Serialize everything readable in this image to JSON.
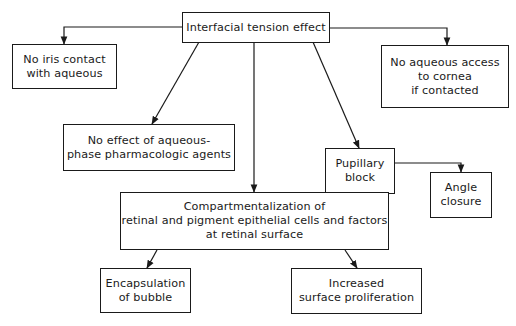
{
  "diagram": {
    "root": {
      "id": "root",
      "label": "Interfacial tension effect"
    },
    "nodes": [
      {
        "id": "iris",
        "label": "No iris contact\nwith aqueous"
      },
      {
        "id": "cornea",
        "label": "No aqueous access\nto cornea\nif contacted"
      },
      {
        "id": "pharm",
        "label": "No effect of aqueous-\nphase pharmacologic agents"
      },
      {
        "id": "pupil",
        "label": "Pupillary\nblock"
      },
      {
        "id": "angle",
        "label": "Angle\nclosure"
      },
      {
        "id": "compart",
        "label": "Compartmentalization of\nretinal and pigment epithelial cells and factors\nat retinal surface"
      },
      {
        "id": "encap",
        "label": "Encapsulation\nof bubble"
      },
      {
        "id": "prolif",
        "label": "Increased\nsurface proliferation"
      }
    ],
    "edges": [
      {
        "from": "root",
        "to": "iris"
      },
      {
        "from": "root",
        "to": "cornea"
      },
      {
        "from": "root",
        "to": "pharm"
      },
      {
        "from": "root",
        "to": "compart"
      },
      {
        "from": "root",
        "to": "pupil"
      },
      {
        "from": "pupil",
        "to": "angle"
      },
      {
        "from": "compart",
        "to": "encap"
      },
      {
        "from": "compart",
        "to": "prolif"
      }
    ]
  }
}
